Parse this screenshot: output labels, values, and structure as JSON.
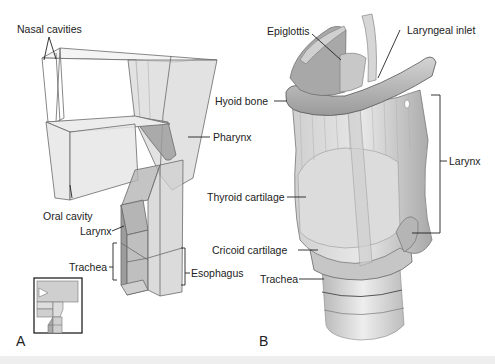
{
  "figure": {
    "panels": [
      {
        "id": "A",
        "letter": "A",
        "description": "Schematic transparent block model of the upper airway and digestive tract",
        "labels": {
          "nasal_cavities": "Nasal cavities",
          "pharynx": "Pharynx",
          "oral_cavity": "Oral cavity",
          "larynx": "Larynx",
          "trachea": "Trachea",
          "esophagus": "Esophagus"
        },
        "inset": "Orientation thumbnail of block model"
      },
      {
        "id": "B",
        "letter": "B",
        "description": "Anatomical illustration of the larynx, posterior-oblique view",
        "labels": {
          "epiglottis": "Epiglottis",
          "laryngeal_inlet": "Laryngeal inlet",
          "hyoid_bone": "Hyoid bone",
          "larynx": "Larynx",
          "thyroid_cartilage": "Thyroid cartilage",
          "cricoid_cartilage": "Cricoid cartilage",
          "trachea": "Trachea"
        }
      }
    ],
    "colors": {
      "background": "#ffffff",
      "line": "#333333",
      "block_fill_light": "#e4e4e4",
      "block_fill_mid": "#bdbdbd",
      "block_fill_dark": "#8f8f8f",
      "tissue_light": "#e8e8e8",
      "tissue_mid": "#c4c4c4",
      "tissue_dark": "#9a9a9a"
    }
  }
}
